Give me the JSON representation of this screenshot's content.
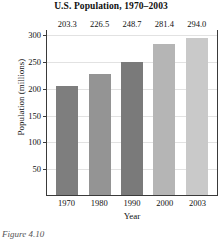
{
  "chart_data": {
    "type": "bar",
    "title": "U.S. Population, 1970–2003",
    "xlabel": "Year",
    "ylabel": "Population (millions)",
    "categories": [
      "1970",
      "1980",
      "1990",
      "2000",
      "2003"
    ],
    "values": [
      203.3,
      226.5,
      248.7,
      281.4,
      294.0
    ],
    "value_labels": [
      "203.3",
      "226.5",
      "248.7",
      "281.4",
      "294.0"
    ],
    "bar_colors": [
      "#7e7e7e",
      "#949494",
      "#7a7a7a",
      "#b5b5b5",
      "#c9c9c9"
    ],
    "ylim": [
      0,
      310
    ],
    "yticks": [
      50,
      100,
      150,
      200,
      250,
      300
    ],
    "ytick_labels": [
      "50",
      "100",
      "150",
      "200",
      "250",
      "300"
    ],
    "grid": true,
    "legend": false
  },
  "caption": {
    "text": "Figure 4.10"
  }
}
